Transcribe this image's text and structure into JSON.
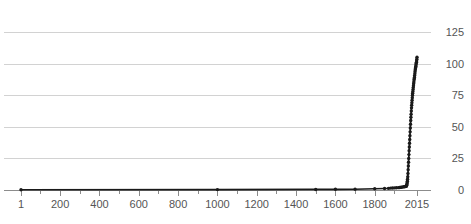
{
  "chart_data": {
    "type": "line",
    "title": "",
    "subtitle": "",
    "xlabel": "",
    "ylabel": "",
    "xlim": [
      1,
      2015
    ],
    "ylim": [
      0,
      125
    ],
    "grid": true,
    "legend": null,
    "legend_position": "none",
    "markers": true,
    "line_color": "#1a1a1a",
    "grid_color": "#d2d2d2",
    "axis_color": "#8c8c8c",
    "text_color": "#555555",
    "background_color": "#ffffff",
    "y_ticks": [
      0,
      25,
      50,
      75,
      100,
      125
    ],
    "y_tick_labels": [
      "0",
      "25",
      "50",
      "75",
      "100",
      "125"
    ],
    "x_ticks": [
      1,
      200,
      400,
      600,
      800,
      1000,
      1200,
      1400,
      1600,
      1800,
      2015
    ],
    "x_tick_labels": [
      "1",
      "200",
      "400",
      "600",
      "800",
      "1000",
      "1200",
      "1400",
      "1600",
      "1800",
      "2015"
    ],
    "x_minor_ticks": [
      100,
      300,
      500,
      700,
      900,
      1100,
      1300,
      1500,
      1700,
      1900
    ],
    "x": [
      1,
      1000,
      1500,
      1600,
      1700,
      1800,
      1850,
      1870,
      1880,
      1890,
      1900,
      1910,
      1920,
      1927,
      1930,
      1935,
      1940,
      1945,
      1950,
      1953,
      1955,
      1957,
      1959,
      1960,
      1961,
      1962,
      1963,
      1964,
      1965,
      1966,
      1967,
      1968,
      1969,
      1970,
      1971,
      1972,
      1973,
      1974,
      1975,
      1976,
      1977,
      1978,
      1979,
      1980,
      1981,
      1982,
      1983,
      1984,
      1985,
      1986,
      1987,
      1988,
      1989,
      1990,
      1991,
      1992,
      1993,
      1994,
      1995,
      1996,
      1997,
      1998,
      1999,
      2000,
      2001,
      2002,
      2003,
      2004,
      2005,
      2006,
      2007,
      2008,
      2009,
      2010,
      2011,
      2012,
      2013,
      2014,
      2015
    ],
    "y": [
      0.2,
      0.3,
      0.45,
      0.55,
      0.6,
      1.0,
      1.2,
      1.3,
      1.5,
      1.6,
      1.65,
      1.75,
      1.86,
      2.0,
      2.07,
      2.15,
      2.3,
      2.5,
      2.54,
      2.7,
      2.8,
      2.9,
      3.0,
      3.03,
      3.2,
      3.5,
      4.0,
      4.8,
      5.8,
      7.0,
      8.5,
      10.5,
      13.0,
      16.0,
      19.0,
      22.0,
      25.0,
      28.0,
      31.0,
      34.0,
      37.0,
      40.0,
      43.0,
      46.0,
      49.0,
      52.0,
      55.0,
      57.5,
      60.0,
      62.5,
      65.0,
      67.0,
      69.0,
      71.0,
      73.0,
      75.0,
      76.5,
      78.0,
      79.5,
      81.0,
      82.5,
      84.0,
      85.5,
      87.0,
      88.0,
      89.0,
      90.5,
      92.0,
      93.5,
      95.0,
      96.0,
      97.0,
      98.0,
      99.0,
      100.0,
      101.0,
      102.0,
      103.5,
      105.0
    ]
  }
}
